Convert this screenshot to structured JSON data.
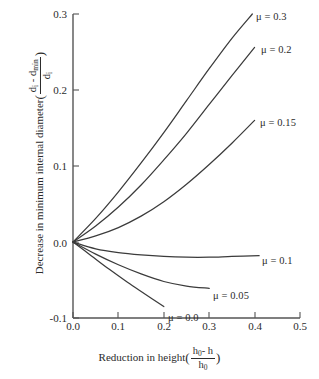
{
  "figure": {
    "background": "#ffffff",
    "line_color": "#3b3b3b",
    "axis_color": "#555555"
  },
  "axes": {
    "x_ticks": [
      "0.0",
      "0.1",
      "0.2",
      "0.3",
      "0.4",
      "0.5"
    ],
    "y_ticks": [
      "0.3",
      "0.2",
      "0.1",
      "0.0",
      "-0.1"
    ],
    "x_title_text": "Reduction in height",
    "x_frac_num": "h",
    "x_frac_num_sub": "0",
    "x_frac_num_tail": "- h",
    "x_frac_den": "h",
    "x_frac_den_sub": "0",
    "y_title_text": "Decrease in minimum internal diameter",
    "y_frac_num_a": "d",
    "y_frac_num_a_sub": "i",
    "y_frac_num_dash": "-",
    "y_frac_num_b": "d",
    "y_frac_num_b_sub": "min",
    "y_frac_den": "d",
    "y_frac_den_sub": "i",
    "open_paren": "(",
    "close_paren": ")"
  },
  "series_labels": {
    "mu_030": "μ = 0.3",
    "mu_020": "μ = 0.2",
    "mu_015": "μ = 0.15",
    "mu_010": "μ = 0.1",
    "mu_005": "μ = 0.05",
    "mu_000": "μ = 0.0"
  },
  "chart_data": {
    "type": "line",
    "title": "",
    "xlabel": "Reduction in height ((h0 - h)/h0)",
    "ylabel": "Decrease in minimum internal diameter ((di - dmin)/di)",
    "xlim": [
      0.0,
      0.5
    ],
    "ylim": [
      -0.1,
      0.3
    ],
    "xticks": [
      0.0,
      0.1,
      0.2,
      0.3,
      0.4,
      0.5
    ],
    "yticks": [
      -0.1,
      0.0,
      0.1,
      0.2,
      0.3
    ],
    "grid": false,
    "legend": "inline-end-of-curve labels",
    "series": [
      {
        "name": "μ = 0.3",
        "x": [
          0.0,
          0.05,
          0.1,
          0.15,
          0.2,
          0.25,
          0.3,
          0.35,
          0.395
        ],
        "y": [
          0.0,
          0.031,
          0.066,
          0.104,
          0.144,
          0.186,
          0.228,
          0.268,
          0.3
        ]
      },
      {
        "name": "μ = 0.2",
        "x": [
          0.0,
          0.05,
          0.1,
          0.15,
          0.2,
          0.25,
          0.3,
          0.35,
          0.4
        ],
        "y": [
          0.0,
          0.021,
          0.046,
          0.075,
          0.108,
          0.143,
          0.181,
          0.219,
          0.256
        ]
      },
      {
        "name": "μ = 0.15",
        "x": [
          0.0,
          0.05,
          0.1,
          0.15,
          0.2,
          0.25,
          0.3,
          0.35,
          0.4
        ],
        "y": [
          0.0,
          0.008,
          0.019,
          0.034,
          0.053,
          0.076,
          0.102,
          0.13,
          0.16
        ]
      },
      {
        "name": "μ = 0.1",
        "x": [
          0.0,
          0.05,
          0.1,
          0.15,
          0.2,
          0.25,
          0.3,
          0.35,
          0.41
        ],
        "y": [
          0.0,
          -0.009,
          -0.014,
          -0.017,
          -0.019,
          -0.02,
          -0.02,
          -0.019,
          -0.018
        ]
      },
      {
        "name": "μ = 0.05",
        "x": [
          0.0,
          0.05,
          0.1,
          0.15,
          0.2,
          0.25,
          0.3
        ],
        "y": [
          0.0,
          -0.016,
          -0.03,
          -0.042,
          -0.052,
          -0.058,
          -0.061
        ]
      },
      {
        "name": "μ = 0.0",
        "x": [
          0.0,
          0.04,
          0.08,
          0.12,
          0.16,
          0.2
        ],
        "y": [
          0.0,
          -0.018,
          -0.036,
          -0.053,
          -0.069,
          -0.085
        ]
      }
    ]
  }
}
